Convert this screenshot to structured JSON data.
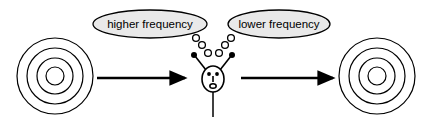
{
  "figure": {
    "type": "concept-diagram",
    "title": "",
    "background_color": "#ffffff",
    "stroke_color": "#000000",
    "bubble_fill_color": "#e9e9e9",
    "width": 431,
    "height": 125
  },
  "thought_bubbles": [
    {
      "id": "higher-frequency-bubble",
      "label": "higher frequency",
      "cx": 150,
      "cy": 24,
      "rx": 57,
      "ry": 14,
      "side": "left",
      "trail_direction": "down-right"
    },
    {
      "id": "lower-frequency-bubble",
      "label": "lower frequency",
      "cx": 279,
      "cy": 24,
      "rx": 51,
      "ry": 14,
      "side": "right",
      "trail_direction": "down-left"
    }
  ],
  "trails": {
    "left": [
      {
        "cx": 195,
        "cy": 38,
        "r": 3.4
      },
      {
        "cx": 203,
        "cy": 45,
        "r": 3.4
      },
      {
        "cx": 208,
        "cy": 53,
        "r": 3.4
      }
    ],
    "right": [
      {
        "cx": 230,
        "cy": 38,
        "r": 3.4
      },
      {
        "cx": 224,
        "cy": 45,
        "r": 3.4
      },
      {
        "cx": 218,
        "cy": 53,
        "r": 3.4
      }
    ]
  },
  "figure_person": {
    "id": "observer-figure",
    "head": {
      "cx": 213,
      "cy": 79,
      "rx": 11,
      "ry": 13
    },
    "eyes": [
      {
        "cx": 209,
        "cy": 74,
        "r": 1.9
      },
      {
        "cx": 217,
        "cy": 74,
        "r": 1.9
      }
    ],
    "nose": {
      "x": 213,
      "y1": 76,
      "y2": 82
    },
    "mouth": {
      "cx": 213,
      "cy": 86,
      "rx": 3.2,
      "ry": 2.3
    },
    "arms": [
      {
        "x1": 205,
        "y1": 70,
        "x2": 194,
        "y2": 55,
        "dot_r": 3.0
      },
      {
        "x1": 221,
        "y1": 70,
        "x2": 232,
        "y2": 55,
        "dot_r": 3.0
      }
    ],
    "body": {
      "x": 213,
      "y1": 92,
      "y2": 117
    }
  },
  "targets": [
    {
      "id": "source-target",
      "cx": 55,
      "cy": 76,
      "ring_radii": [
        38,
        28,
        18,
        9
      ],
      "position": "left"
    },
    {
      "id": "result-target",
      "cx": 377,
      "cy": 76,
      "ring_radii": [
        38,
        28,
        18,
        9
      ],
      "position": "right"
    }
  ],
  "arrows": [
    {
      "id": "arrow-source-to-observer",
      "x1": 97,
      "y1": 78,
      "x2": 188,
      "y2": 78,
      "direction": "right"
    },
    {
      "id": "arrow-observer-to-result",
      "x1": 241,
      "y1": 78,
      "x2": 336,
      "y2": 78,
      "direction": "right"
    }
  ]
}
